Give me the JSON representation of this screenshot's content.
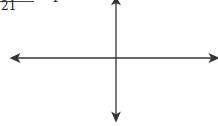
{
  "equation": {
    "denominator": "21",
    "rhs": "= 1"
  },
  "axes": {
    "color": "#333333",
    "origin": {
      "x": 116,
      "y": 58
    },
    "x_axis": {
      "from": 12,
      "to": 217,
      "arrows": [
        "left",
        "right"
      ]
    },
    "y_axis": {
      "from": 0,
      "to": 120,
      "arrows": [
        "up",
        "down"
      ]
    }
  }
}
